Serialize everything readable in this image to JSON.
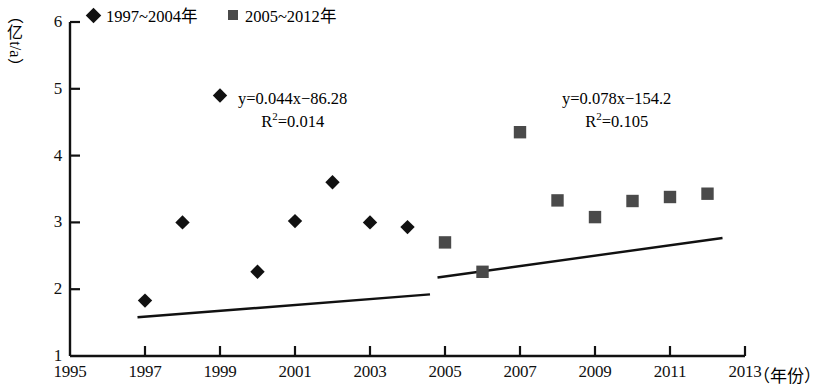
{
  "chart_data": {
    "type": "scatter",
    "title": "",
    "xlabel": "年份",
    "ylabel": "亿 t/a",
    "xlim": [
      1995,
      2013
    ],
    "ylim": [
      1,
      6
    ],
    "xticks": [
      1995,
      1997,
      1999,
      2001,
      2003,
      2005,
      2007,
      2009,
      2011,
      2013
    ],
    "yticks": [
      1,
      2,
      3,
      4,
      5,
      6
    ],
    "grid": false,
    "legend_position": "top",
    "series": [
      {
        "name": "1997~2004年",
        "marker": "diamond",
        "color": "#111111",
        "x": [
          1997,
          1998,
          1999,
          2000,
          2001,
          2002,
          2003,
          2004
        ],
        "values": [
          1.83,
          3.0,
          4.9,
          2.26,
          3.02,
          3.6,
          3.0,
          2.93
        ],
        "trendline": {
          "equation": "y=0.044x−86.28",
          "r2_label": "R",
          "r2_exp": "2",
          "r2_value": "=0.014",
          "slope": 0.044,
          "intercept": -86.28,
          "x_start": 1996.8,
          "x_end": 2004.6
        }
      },
      {
        "name": "2005~2012年",
        "marker": "square",
        "color": "#4a4a4a",
        "x": [
          2005,
          2006,
          2007,
          2008,
          2009,
          2010,
          2011,
          2012
        ],
        "values": [
          2.7,
          2.26,
          4.35,
          3.33,
          3.08,
          3.32,
          3.38,
          3.43
        ],
        "trendline": {
          "equation": "y=0.078x−154.2",
          "r2_label": "R",
          "r2_exp": "2",
          "r2_value": "=0.105",
          "slope": 0.078,
          "intercept": -154.2,
          "x_start": 2004.8,
          "x_end": 2012.4
        }
      }
    ]
  },
  "axes": {
    "y_unit_open": "（",
    "y_unit_char": "亿",
    "y_unit_rest": "t/a",
    "y_unit_close": "）",
    "x_unit": "（年份）",
    "xtick_labels": [
      "1995",
      "1997",
      "1999",
      "2001",
      "2003",
      "2005",
      "2007",
      "2009",
      "2011",
      "2013"
    ],
    "ytick_labels": [
      "6",
      "5",
      "4",
      "3",
      "2",
      "1"
    ]
  },
  "legend": {
    "items": [
      {
        "label": "1997~2004年",
        "marker": "diamond"
      },
      {
        "label": "2005~2012年",
        "marker": "square"
      }
    ]
  },
  "equations": {
    "left": {
      "line1": "y=0.044x−86.28",
      "r_prefix": "R",
      "r_sup": "2",
      "r_suffix": "=0.014"
    },
    "right": {
      "line1": "y=0.078x−154.2",
      "r_prefix": "R",
      "r_sup": "2",
      "r_suffix": "=0.105"
    }
  }
}
